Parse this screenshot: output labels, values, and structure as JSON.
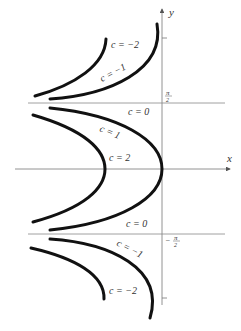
{
  "figure": {
    "axes": {
      "x_label": "x",
      "y_label": "y"
    },
    "asymptotes": {
      "upper_label_num": "π",
      "upper_label_den": "2",
      "lower_label": "− π/2",
      "lower_label_sign": "−",
      "lower_label_num": "π",
      "lower_label_den": "2"
    },
    "curve_labels": {
      "top_outer": "c = −2",
      "top_inner": "c = −1",
      "mid_c0_top": "c = 0",
      "mid_c1": "c = 1",
      "mid_c2": "c = 2",
      "mid_c0_bottom": "c = 0",
      "bottom_inner": "c = −1",
      "bottom_outer": "c = −2"
    },
    "colors": {
      "curve": "#111111",
      "axis": "#777777",
      "text": "#333333"
    }
  }
}
